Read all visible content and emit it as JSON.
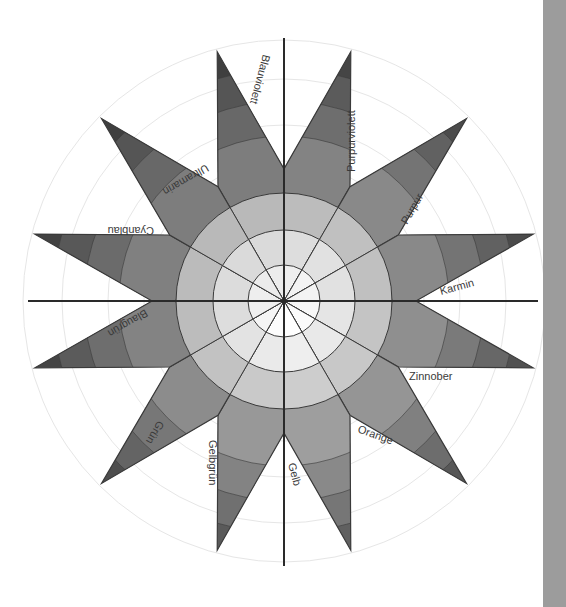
{
  "diagram": {
    "type": "twelve-point color star (Itten Farbstern), grayscale reproduction",
    "center": [
      284,
      301
    ],
    "axis_half_length": 263,
    "guide_circle_radii": [
      140,
      176,
      222,
      261
    ],
    "disc_ring_radii": [
      36,
      71,
      108
    ],
    "star_valley_radius": 132,
    "star_tip_radius": 258,
    "spike_band_radii": [
      165,
      200,
      232
    ],
    "colors": {
      "background": "#ffffff",
      "axis": "#2a2a2a",
      "outline": "#3a3a3a",
      "guide": "#e6e6e6",
      "side_bar": "#9c9c9c",
      "ring_1": "#f5f5f5",
      "ring_2": "#e3e3e3",
      "ring_3": "#c2c2c2",
      "ring_4": "#a0a0a0",
      "band_1": "#8c8c8c",
      "band_2": "#777777",
      "band_3": "#646464",
      "band_4": "#4e4e4e"
    },
    "segments": [
      {
        "name": "Blauviolett",
        "tip_angle": 105,
        "shade": -0.1
      },
      {
        "name": "Purpurviolett",
        "tip_angle": 75,
        "shade": -0.06
      },
      {
        "name": "Purpur",
        "tip_angle": 45,
        "shade": -0.02
      },
      {
        "name": "Karmin",
        "tip_angle": 15,
        "shade": -0.02
      },
      {
        "name": "Zinnober",
        "tip_angle": -15,
        "shade": 0.02
      },
      {
        "name": "Orange",
        "tip_angle": -45,
        "shade": 0.06
      },
      {
        "name": "Gelb",
        "tip_angle": -75,
        "shade": 0.12
      },
      {
        "name": "Gelbgrün",
        "tip_angle": -105,
        "shade": 0.08
      },
      {
        "name": "Grün",
        "tip_angle": -135,
        "shade": 0.0
      },
      {
        "name": "Blaugrün",
        "tip_angle": -165,
        "shade": -0.06
      },
      {
        "name": "Cyanblau",
        "tip_angle": 165,
        "shade": -0.08
      },
      {
        "name": "Ultramarin",
        "tip_angle": 135,
        "shade": -0.1
      }
    ],
    "labels": [
      {
        "text": "Blauviolett",
        "x": 263,
        "y": 54,
        "rotate": 105
      },
      {
        "text": "Purpurviolett",
        "x": 355,
        "y": 172,
        "rotate": -90
      },
      {
        "text": "Purpur",
        "x": 407,
        "y": 225,
        "rotate": -60
      },
      {
        "text": "Karmin",
        "x": 441,
        "y": 295,
        "rotate": -15
      },
      {
        "text": "Zinnober",
        "x": 409,
        "y": 380,
        "rotate": 0
      },
      {
        "text": "Orange",
        "x": 357,
        "y": 432,
        "rotate": 20
      },
      {
        "text": "Gelb",
        "x": 288,
        "y": 464,
        "rotate": 75
      },
      {
        "text": "Gelbgrün",
        "x": 209,
        "y": 440,
        "rotate": 90
      },
      {
        "text": "Grün",
        "x": 158,
        "y": 420,
        "rotate": 120
      },
      {
        "text": "Blaugrün",
        "x": 145,
        "y": 309,
        "rotate": 150
      },
      {
        "text": "Cyanblau",
        "x": 154,
        "y": 227,
        "rotate": 180
      },
      {
        "text": "Ultramarin",
        "x": 206,
        "y": 164,
        "rotate": 150
      }
    ]
  }
}
